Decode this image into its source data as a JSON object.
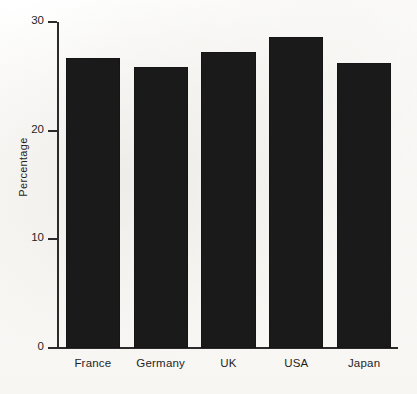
{
  "chart_data": {
    "type": "bar",
    "title": "",
    "subtitle": "",
    "xlabel": "",
    "ylabel": "Percentage",
    "categories": [
      "France",
      "Germany",
      "UK",
      "USA",
      "Japan"
    ],
    "values": [
      26.7,
      25.9,
      27.2,
      28.6,
      26.2
    ],
    "series": [
      {
        "name": "Percentage",
        "values": [
          26.7,
          25.9,
          27.2,
          28.6,
          26.2
        ]
      }
    ],
    "ylim": [
      0,
      30
    ],
    "xlim_note": "categorical",
    "ytick_labels": [
      "0",
      "10",
      "20",
      "30"
    ],
    "ytick_values": [
      0,
      10,
      20,
      30
    ],
    "grid": false,
    "legend": false,
    "legend_position": "none",
    "annotations": [],
    "bar_color": "#1a1a1a",
    "axis_color": "#2b2b2b",
    "background_color": "#fdfdfc"
  },
  "axis": {
    "y_title": "Percentage"
  }
}
